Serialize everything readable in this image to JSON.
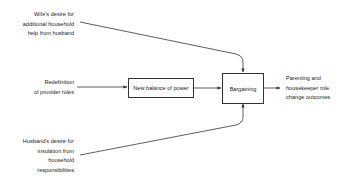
{
  "inputs": {
    "wife": [
      "Wife's desire for",
      "additional household",
      "help from husband"
    ],
    "provider": [
      "Redefinition",
      "of provider roles"
    ],
    "husband": [
      "Husband's desire for",
      "insulation from",
      "household",
      "responsibilities"
    ]
  },
  "boxes": {
    "balance": "New balance of power",
    "bargaining": "Bargaining"
  },
  "output": [
    "Parenting and",
    "housekeeper role",
    "change outcomes"
  ],
  "colors": {
    "line": "#333333",
    "text": "#222222",
    "background": "#ffffff"
  }
}
